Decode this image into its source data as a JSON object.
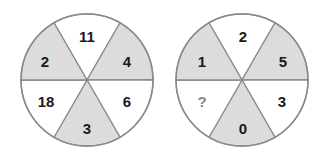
{
  "colors": {
    "shaded": "#dcdcdc",
    "unshaded": "#ffffff",
    "stroke": "#8a8a8a",
    "text": "#1a1a1a",
    "question": "#888888"
  },
  "circles": [
    {
      "name": "left-wheel",
      "segments": {
        "top": "11",
        "top_right": "4",
        "bottom_right": "6",
        "bottom": "3",
        "bottom_left": "18",
        "top_left": "2"
      }
    },
    {
      "name": "right-wheel",
      "segments": {
        "top": "2",
        "top_right": "5",
        "bottom_right": "3",
        "bottom": "0",
        "bottom_left": "?",
        "top_left": "1"
      }
    }
  ]
}
